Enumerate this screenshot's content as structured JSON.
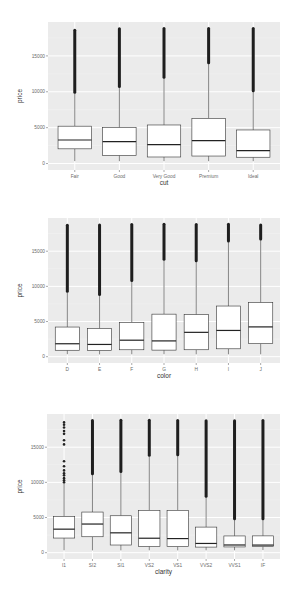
{
  "chart_data": [
    {
      "type": "boxplot",
      "title": "",
      "xlabel": "cut",
      "ylabel": "price",
      "ylim": [
        0,
        18823
      ],
      "yticks": [
        0,
        5000,
        10000,
        15000
      ],
      "ytick_labels": [
        "0",
        "5000",
        "10000",
        "15000"
      ],
      "grid": true,
      "categories": [
        "Fair",
        "Good",
        "Very Good",
        "Premium",
        "Ideal"
      ],
      "boxes": [
        {
          "q1": 2050,
          "median": 3282,
          "q3": 5206,
          "whisker_low": 337,
          "whisker_high": 9800,
          "outlier_max": 18574
        },
        {
          "q1": 1145,
          "median": 3050,
          "q3": 5028,
          "whisker_low": 327,
          "whisker_high": 10600,
          "outlier_max": 18788
        },
        {
          "q1": 912,
          "median": 2648,
          "q3": 5373,
          "whisker_low": 336,
          "whisker_high": 11900,
          "outlier_max": 18818
        },
        {
          "q1": 1046,
          "median": 3185,
          "q3": 6296,
          "whisker_low": 326,
          "whisker_high": 13900,
          "outlier_max": 18823
        },
        {
          "q1": 878,
          "median": 1810,
          "q3": 4678,
          "whisker_low": 326,
          "whisker_high": 10000,
          "outlier_max": 18806
        }
      ]
    },
    {
      "type": "boxplot",
      "title": "",
      "xlabel": "color",
      "ylabel": "price",
      "ylim": [
        0,
        18823
      ],
      "yticks": [
        0,
        5000,
        10000,
        15000
      ],
      "ytick_labels": [
        "0",
        "5000",
        "10000",
        "15000"
      ],
      "grid": true,
      "categories": [
        "D",
        "E",
        "F",
        "G",
        "H",
        "I",
        "J"
      ],
      "boxes": [
        {
          "q1": 911,
          "median": 1838,
          "q3": 4214,
          "whisker_low": 357,
          "whisker_high": 9150,
          "outlier_max": 18693
        },
        {
          "q1": 882,
          "median": 1739,
          "q3": 4003,
          "whisker_low": 326,
          "whisker_high": 8700,
          "outlier_max": 18731
        },
        {
          "q1": 982,
          "median": 2343,
          "q3": 4868,
          "whisker_low": 342,
          "whisker_high": 10700,
          "outlier_max": 18791
        },
        {
          "q1": 931,
          "median": 2242,
          "q3": 6048,
          "whisker_low": 354,
          "whisker_high": 13700,
          "outlier_max": 18818
        },
        {
          "q1": 984,
          "median": 3460,
          "q3": 5980,
          "whisker_low": 337,
          "whisker_high": 13500,
          "outlier_max": 18803
        },
        {
          "q1": 1120,
          "median": 3730,
          "q3": 7202,
          "whisker_low": 334,
          "whisker_high": 16300,
          "outlier_max": 18823
        },
        {
          "q1": 1860,
          "median": 4234,
          "q3": 7695,
          "whisker_low": 335,
          "whisker_high": 16600,
          "outlier_max": 18710
        }
      ]
    },
    {
      "type": "boxplot",
      "title": "",
      "xlabel": "clarity",
      "ylabel": "price",
      "ylim": [
        0,
        18823
      ],
      "yticks": [
        0,
        5000,
        10000,
        15000
      ],
      "ytick_labels": [
        "0",
        "5000",
        "10000",
        "15000"
      ],
      "grid": true,
      "categories": [
        "I1",
        "SI2",
        "SI1",
        "VS2",
        "VS1",
        "VVS2",
        "VVS1",
        "IF"
      ],
      "boxes": [
        {
          "q1": 2080,
          "median": 3344,
          "q3": 5161,
          "whisker_low": 345,
          "whisker_high": 9800,
          "outlier_max": 18531,
          "sparse_outliers": [
            10000,
            10300,
            10600,
            11000,
            11300,
            11700,
            12300,
            13000,
            15400,
            16000,
            16900,
            17300,
            17800,
            18200,
            18531
          ]
        },
        {
          "q1": 2264,
          "median": 4072,
          "q3": 5777,
          "whisker_low": 326,
          "whisker_high": 11100,
          "outlier_max": 18804
        },
        {
          "q1": 1089,
          "median": 2822,
          "q3": 5250,
          "whisker_low": 326,
          "whisker_high": 11400,
          "outlier_max": 18818
        },
        {
          "q1": 900,
          "median": 2054,
          "q3": 6024,
          "whisker_low": 334,
          "whisker_high": 13700,
          "outlier_max": 18823
        },
        {
          "q1": 876,
          "median": 2005,
          "q3": 6023,
          "whisker_low": 327,
          "whisker_high": 13800,
          "outlier_max": 18795
        },
        {
          "q1": 794,
          "median": 1311,
          "q3": 3638,
          "whisker_low": 336,
          "whisker_high": 7900,
          "outlier_max": 18768
        },
        {
          "q1": 816,
          "median": 1093,
          "q3": 2379,
          "whisker_low": 336,
          "whisker_high": 4700,
          "outlier_max": 18777
        },
        {
          "q1": 895,
          "median": 1080,
          "q3": 2388,
          "whisker_low": 369,
          "whisker_high": 4700,
          "outlier_max": 18806
        }
      ]
    }
  ]
}
